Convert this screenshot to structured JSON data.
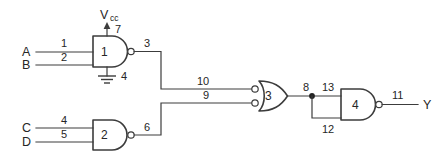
{
  "diagram": {
    "colors": {
      "line": "#3c3c3c",
      "text": "#262626",
      "background": "#ffffff",
      "junction": "#222222"
    },
    "power": {
      "vcc_label": "V",
      "vcc_subscript": "cc",
      "vcc_pin": "7",
      "ground_pin": "4"
    },
    "inputs": [
      {
        "name": "A",
        "label": "A",
        "pin": "1"
      },
      {
        "name": "B",
        "label": "B",
        "pin": "2"
      },
      {
        "name": "C",
        "label": "C",
        "pin": "4"
      },
      {
        "name": "D",
        "label": "D",
        "pin": "5"
      }
    ],
    "outputs": [
      {
        "name": "Y",
        "label": "Y",
        "pin": "11"
      }
    ],
    "gates": [
      {
        "id": "gate-1",
        "number": "1",
        "type": "nand",
        "output_pin": "3"
      },
      {
        "id": "gate-2",
        "number": "2",
        "type": "nand",
        "output_pin": "6"
      },
      {
        "id": "gate-3",
        "number": "3",
        "type": "negative-input-or",
        "input_pins": [
          "10",
          "9"
        ],
        "output_pin": "8"
      },
      {
        "id": "gate-4",
        "number": "4",
        "type": "nand",
        "input_pins": [
          "13",
          "12"
        ],
        "output_pin": "11"
      }
    ],
    "pin_numbers": {
      "a_in": "1",
      "b_in": "2",
      "g1_vcc": "7",
      "g1_gnd": "4",
      "g1_out": "3",
      "c_in": "4",
      "d_in": "5",
      "g2_out": "6",
      "g3_in_top": "10",
      "g3_in_bottom": "9",
      "g3_out": "8",
      "g4_in_top": "13",
      "g4_in_bottom": "12",
      "g4_out": "11"
    }
  }
}
